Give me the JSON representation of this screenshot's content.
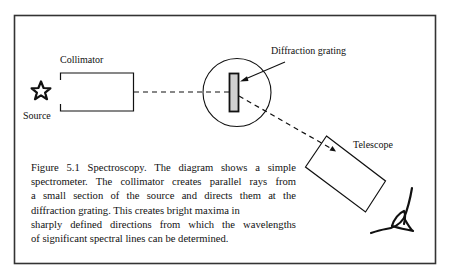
{
  "figure": {
    "labels": {
      "collimator": "Collimator",
      "source": "Source",
      "diffraction_grating": "Diffraction grating",
      "telescope": "Telescope"
    },
    "caption_lines": [
      "Figure 5.1 Spectroscopy. The diagram shows a simple",
      "spectrometer. The collimator creates parallel rays from",
      "a small section of the source and directs them at the",
      "diffraction grating. This creates bright maxima in",
      "sharply defined directions from which the wavelengths",
      "of significant spectral lines can be determined."
    ],
    "icons": {
      "source": "star-icon",
      "observer": "eye-icon"
    },
    "colors": {
      "stroke": "#111111",
      "frame": "#333333",
      "grating_fill": "#d0d0d0",
      "background": "#ffffff"
    }
  }
}
